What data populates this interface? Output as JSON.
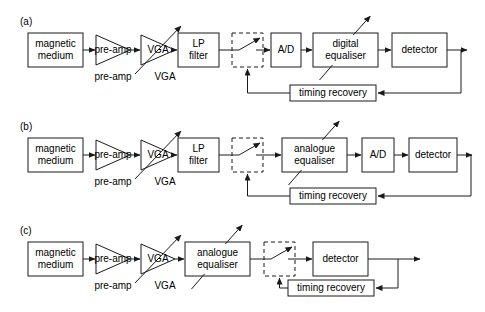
{
  "figure": {
    "background_color": "#ffffff",
    "line_color": "#1a1a1a",
    "text_color": "#000000",
    "width": 485,
    "height": 312
  },
  "panels": [
    {
      "id": "a",
      "label": "(a)",
      "caption": "fully digital equalisation read channel",
      "blocks": [
        {
          "key": "source",
          "label": "magnetic\nmedium",
          "line1": "magnetic",
          "line2": "medium",
          "shape": "rect",
          "x": 28,
          "y": 33,
          "w": 55,
          "h": 34
        },
        {
          "key": "preamp",
          "label": "pre-amp",
          "line1": "pre-amp",
          "line2": "",
          "shape": "triangle",
          "x": 96,
          "y": 35,
          "w": 34,
          "h": 30
        },
        {
          "key": "vga",
          "label": "VGA",
          "line1": "VGA",
          "line2": "",
          "shape": "triangle-variable",
          "x": 141,
          "y": 35,
          "w": 34,
          "h": 30
        },
        {
          "key": "lpfilter",
          "label": "LP\nfilter",
          "line1": "LP",
          "line2": "filter",
          "shape": "rect",
          "x": 178,
          "y": 33,
          "w": 41,
          "h": 34
        },
        {
          "key": "sampler",
          "label": "",
          "line1": "",
          "line2": "",
          "shape": "switch",
          "x": 232,
          "y": 33,
          "w": 31,
          "h": 34
        },
        {
          "key": "adc",
          "label": "A/D",
          "line1": "A/D",
          "line2": "",
          "shape": "rect",
          "x": 271,
          "y": 33,
          "w": 30,
          "h": 34
        },
        {
          "key": "equaliser",
          "label": "digital\nequaliser",
          "line1": "digital",
          "line2": "equaliser",
          "shape": "rect-adaptive",
          "x": 313,
          "y": 33,
          "w": 65,
          "h": 34
        },
        {
          "key": "detector",
          "label": "detector",
          "line1": "detector",
          "line2": "",
          "shape": "rect",
          "x": 392,
          "y": 33,
          "w": 55,
          "h": 34
        },
        {
          "key": "timing",
          "label": "timing recovery",
          "line1": "timing recovery",
          "line2": "",
          "shape": "rect",
          "x": 290,
          "y": 85,
          "w": 86,
          "h": 16
        }
      ],
      "side_labels": [
        {
          "key": "preamp-label",
          "text": "pre-amp",
          "x": 113,
          "y": 77
        },
        {
          "key": "vga-label",
          "text": "VGA",
          "x": 165,
          "y": 77
        }
      ],
      "output_arrow": {
        "x1": 447,
        "y1": 50,
        "x2": 467,
        "y2": 50
      }
    },
    {
      "id": "b",
      "label": "(b)",
      "caption": "analogue equalisation with digital detection read channel",
      "blocks": [
        {
          "key": "source",
          "label": "magnetic\nmedium",
          "line1": "magnetic",
          "line2": "medium",
          "shape": "rect",
          "x": 28,
          "y": 138,
          "w": 55,
          "h": 34
        },
        {
          "key": "preamp",
          "label": "pre-amp",
          "line1": "pre-amp",
          "line2": "",
          "shape": "triangle",
          "x": 96,
          "y": 140,
          "w": 34,
          "h": 30
        },
        {
          "key": "vga",
          "label": "VGA",
          "line1": "VGA",
          "line2": "",
          "shape": "triangle-variable",
          "x": 141,
          "y": 140,
          "w": 34,
          "h": 30
        },
        {
          "key": "lpfilter",
          "label": "LP\nfilter",
          "line1": "LP",
          "line2": "filter",
          "shape": "rect",
          "x": 178,
          "y": 138,
          "w": 41,
          "h": 34
        },
        {
          "key": "sampler",
          "label": "",
          "line1": "",
          "line2": "",
          "shape": "switch",
          "x": 232,
          "y": 138,
          "w": 31,
          "h": 34
        },
        {
          "key": "equaliser",
          "label": "analogue\nequaliser",
          "line1": "analogue",
          "line2": "equaliser",
          "shape": "rect-adaptive",
          "x": 282,
          "y": 138,
          "w": 65,
          "h": 34
        },
        {
          "key": "adc",
          "label": "A/D",
          "line1": "A/D",
          "line2": "",
          "shape": "rect",
          "x": 362,
          "y": 138,
          "w": 32,
          "h": 34
        },
        {
          "key": "detector",
          "label": "detector",
          "line1": "detector",
          "line2": "",
          "shape": "rect",
          "x": 409,
          "y": 138,
          "w": 48,
          "h": 34
        },
        {
          "key": "timing",
          "label": "timing recovery",
          "line1": "timing recovery",
          "line2": "",
          "shape": "rect",
          "x": 290,
          "y": 188,
          "w": 86,
          "h": 16
        }
      ],
      "side_labels": [
        {
          "key": "preamp-label",
          "text": "pre-amp",
          "x": 113,
          "y": 182
        },
        {
          "key": "vga-label",
          "text": "VGA",
          "x": 165,
          "y": 182
        }
      ],
      "output_arrow": {
        "x1": 457,
        "y1": 155,
        "x2": 472,
        "y2": 155
      }
    },
    {
      "id": "c",
      "label": "(c)",
      "caption": "fully analogue equalisation read channel",
      "blocks": [
        {
          "key": "source",
          "label": "magnetic\nmedium",
          "line1": "magnetic",
          "line2": "medium",
          "shape": "rect",
          "x": 28,
          "y": 242,
          "w": 55,
          "h": 34
        },
        {
          "key": "preamp",
          "label": "pre-amp",
          "line1": "pre-amp",
          "line2": "",
          "shape": "triangle",
          "x": 96,
          "y": 244,
          "w": 34,
          "h": 30
        },
        {
          "key": "vga",
          "label": "VGA",
          "line1": "VGA",
          "line2": "",
          "shape": "triangle-variable",
          "x": 141,
          "y": 244,
          "w": 34,
          "h": 30
        },
        {
          "key": "equaliser",
          "label": "analogue\nequaliser",
          "line1": "analogue",
          "line2": "equaliser",
          "shape": "rect-adaptive",
          "x": 185,
          "y": 242,
          "w": 65,
          "h": 34
        },
        {
          "key": "sampler",
          "label": "",
          "line1": "",
          "line2": "",
          "shape": "switch",
          "x": 264,
          "y": 242,
          "w": 31,
          "h": 34
        },
        {
          "key": "detector",
          "label": "detector",
          "line1": "detector",
          "line2": "",
          "shape": "rect",
          "x": 313,
          "y": 242,
          "w": 55,
          "h": 34
        },
        {
          "key": "timing",
          "label": "timing recovery",
          "line1": "timing recovery",
          "line2": "",
          "shape": "rect",
          "x": 288,
          "y": 280,
          "w": 86,
          "h": 16
        }
      ],
      "side_labels": [
        {
          "key": "preamp-label",
          "text": "pre-amp",
          "x": 113,
          "y": 286
        },
        {
          "key": "vga-label",
          "text": "VGA",
          "x": 165,
          "y": 286
        }
      ],
      "output_arrow": {
        "x1": 393,
        "y1": 259,
        "x2": 420,
        "y2": 259
      }
    }
  ],
  "panel_label_positions": [
    {
      "id": "a",
      "x": 20,
      "y": 22
    },
    {
      "id": "b",
      "x": 20,
      "y": 127
    },
    {
      "id": "c",
      "x": 20,
      "y": 231
    }
  ],
  "legend": {
    "block_names": [
      "magnetic medium",
      "pre-amp",
      "VGA",
      "LP filter",
      "A/D",
      "digital equaliser",
      "analogue equaliser",
      "detector",
      "timing recovery"
    ]
  }
}
